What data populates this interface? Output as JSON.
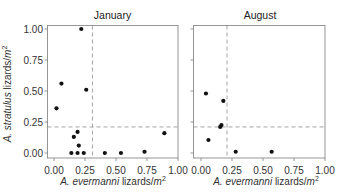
{
  "labels": {
    "x": {
      "species": "A. evermanni",
      "unit": " lizards/",
      "unit_var": "m",
      "unit_exp": "2"
    },
    "y": {
      "species": "A. stratulus",
      "unit": " lizards/",
      "unit_var": "m",
      "unit_exp": "2"
    }
  },
  "colors": {
    "points": "#111111",
    "frame": "#8a8a8a",
    "reference_lines": "#9a9a9a"
  },
  "chart_data": [
    {
      "type": "scatter",
      "title": "January",
      "xlabel": "A. evermanni lizards/m²",
      "ylabel": "A. stratulus lizards/m²",
      "xlim": [
        0,
        1
      ],
      "ylim": [
        0,
        1
      ],
      "xticks": [
        "0.00",
        "0.25",
        "0.50",
        "0.75",
        "1.00"
      ],
      "yticks": [
        "0.00",
        "0.25",
        "0.50",
        "0.75",
        "1.00"
      ],
      "show_ytick_labels": true,
      "grid": false,
      "reference_lines": {
        "vertical_x": 0.31,
        "horizontal_y": 0.21,
        "style": "dashed"
      },
      "points": [
        {
          "x": 0.02,
          "y": 0.36
        },
        {
          "x": 0.06,
          "y": 0.56
        },
        {
          "x": 0.22,
          "y": 1.0
        },
        {
          "x": 0.26,
          "y": 0.51
        },
        {
          "x": 0.19,
          "y": 0.17
        },
        {
          "x": 0.16,
          "y": 0.13
        },
        {
          "x": 0.2,
          "y": 0.06
        },
        {
          "x": 0.14,
          "y": 0.0
        },
        {
          "x": 0.19,
          "y": 0.0
        },
        {
          "x": 0.24,
          "y": 0.0
        },
        {
          "x": 0.41,
          "y": 0.0
        },
        {
          "x": 0.54,
          "y": 0.0
        },
        {
          "x": 0.73,
          "y": 0.01
        },
        {
          "x": 0.89,
          "y": 0.16
        }
      ]
    },
    {
      "type": "scatter",
      "title": "August",
      "xlabel": "A. evermanni lizards/m²",
      "ylabel": "A. stratulus lizards/m²",
      "xlim": [
        0,
        1
      ],
      "ylim": [
        0,
        1
      ],
      "xticks": [
        "0.00",
        "0.25",
        "0.50",
        "0.75",
        "1.00"
      ],
      "yticks": [
        "0.00",
        "0.25",
        "0.50",
        "0.75",
        "1.00"
      ],
      "show_ytick_labels": false,
      "grid": false,
      "reference_lines": {
        "vertical_x": 0.21,
        "horizontal_y": 0.21,
        "style": "dashed"
      },
      "points": [
        {
          "x": 0.04,
          "y": 0.48
        },
        {
          "x": 0.18,
          "y": 0.42
        },
        {
          "x": 0.155,
          "y": 0.21
        },
        {
          "x": 0.165,
          "y": 0.225
        },
        {
          "x": 0.06,
          "y": 0.105
        },
        {
          "x": 0.28,
          "y": 0.01
        },
        {
          "x": 0.57,
          "y": 0.01
        }
      ]
    }
  ]
}
